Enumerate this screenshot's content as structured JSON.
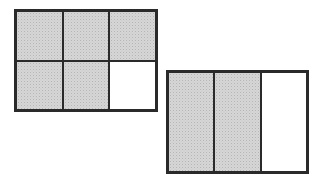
{
  "figures": [
    {
      "id": "fraction-2x3",
      "rows": 2,
      "cols": 3,
      "shaded_cells": 5,
      "total_cells": 6,
      "cells": [
        "shaded",
        "shaded",
        "shaded",
        "shaded",
        "shaded",
        "empty"
      ]
    },
    {
      "id": "fraction-1x3",
      "rows": 1,
      "cols": 3,
      "shaded_cells": 2,
      "total_cells": 3,
      "cells": [
        "shaded",
        "shaded",
        "empty"
      ]
    }
  ],
  "colors": {
    "border": "#2a2a2a",
    "shade": "#d6d6d6",
    "empty": "#ffffff"
  }
}
